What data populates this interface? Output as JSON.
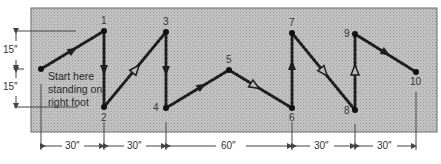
{
  "diagram": {
    "start_note": [
      "Start here",
      "standing on",
      "right foot"
    ],
    "points": [
      {
        "id": "start",
        "label": "",
        "x": 41,
        "y": 69
      },
      {
        "id": "1",
        "label": "1",
        "x": 104,
        "y": 31
      },
      {
        "id": "2",
        "label": "2",
        "x": 104,
        "y": 107
      },
      {
        "id": "3",
        "label": "3",
        "x": 166,
        "y": 32
      },
      {
        "id": "4",
        "label": "4",
        "x": 166,
        "y": 108
      },
      {
        "id": "5",
        "label": "5",
        "x": 229,
        "y": 70
      },
      {
        "id": "6",
        "label": "6",
        "x": 292,
        "y": 108
      },
      {
        "id": "7",
        "label": "7",
        "x": 292,
        "y": 33
      },
      {
        "id": "8",
        "label": "8",
        "x": 355,
        "y": 110
      },
      {
        "id": "9",
        "label": "9",
        "x": 355,
        "y": 34
      },
      {
        "id": "10",
        "label": "10",
        "x": 416,
        "y": 72
      }
    ],
    "vertical_dimensions": [
      {
        "label": "15″"
      },
      {
        "label": "15″"
      }
    ],
    "horizontal_dimensions": [
      {
        "label": "30″"
      },
      {
        "label": "30″"
      },
      {
        "label": "60″"
      },
      {
        "label": "30″"
      },
      {
        "label": "30″"
      }
    ],
    "colors": {
      "field": "#b9b9b9",
      "field_border": "#6a6a6a",
      "path": "#1e1e1e",
      "dimension_lines": "#444444"
    }
  }
}
